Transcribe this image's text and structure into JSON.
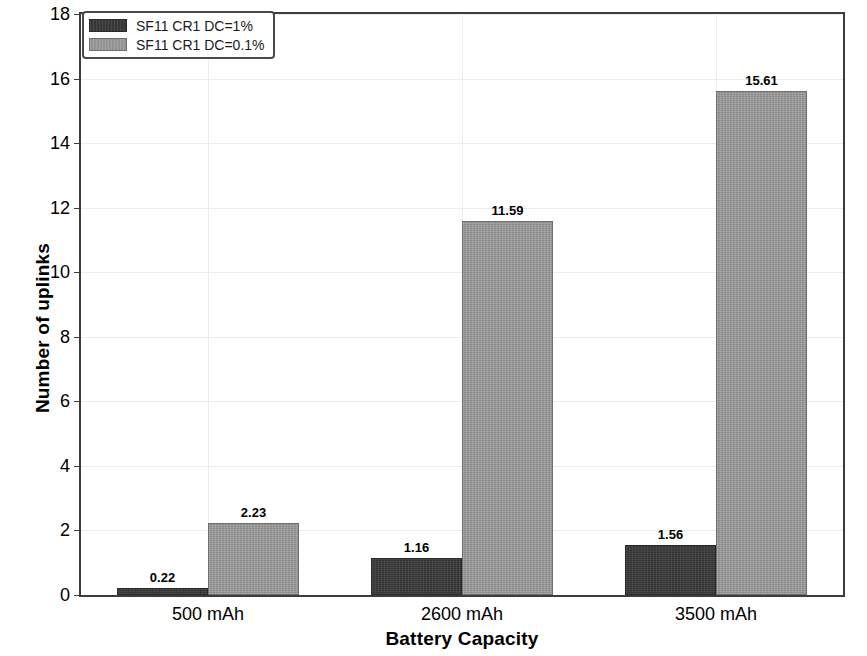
{
  "chart_data": {
    "type": "bar",
    "title": "",
    "xlabel": "Battery Capacity",
    "ylabel": "Number of uplinks",
    "categories": [
      "500 mAh",
      "2600 mAh",
      "3500 mAh"
    ],
    "series": [
      {
        "name": "SF11 CR1 DC=1%",
        "color": "#3a3a3a",
        "values": [
          0.22,
          1.16,
          1.56
        ],
        "labels": [
          "0.22",
          "1.16",
          "1.56"
        ]
      },
      {
        "name": "SF11 CR1 DC=0.1%",
        "color": "#9b9b9b",
        "values": [
          2.23,
          11.59,
          15.61
        ],
        "labels": [
          "2.23",
          "11.59",
          "15.61"
        ]
      }
    ],
    "ylim": [
      0,
      18
    ],
    "yticks": [
      0,
      2,
      4,
      6,
      8,
      10,
      12,
      14,
      16,
      18
    ],
    "ytick_labels": [
      "0",
      "2",
      "4",
      "6",
      "8",
      "10",
      "12",
      "14",
      "16",
      "18"
    ],
    "grid": true,
    "grid_axis": "both",
    "legend_position": "top-left"
  },
  "axes": {
    "y_title": "Number of uplinks",
    "x_title": "Battery Capacity"
  },
  "legend": {
    "entries": [
      {
        "label": "SF11 CR1 DC=1%",
        "swatch": "dark"
      },
      {
        "label": "SF11 CR1 DC=0.1%",
        "swatch": "light"
      }
    ]
  }
}
